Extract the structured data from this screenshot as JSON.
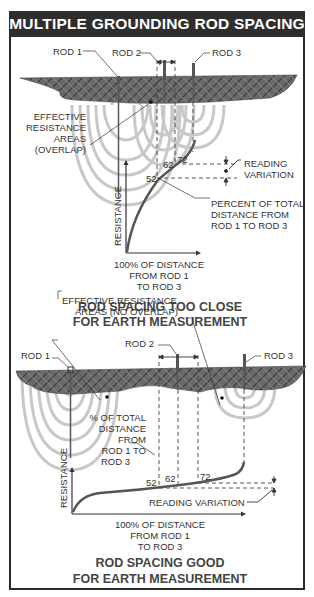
{
  "title": "MULTIPLE GROUNDING ROD SPACING",
  "panels": [
    {
      "id": "too-close",
      "rod_labels": [
        "ROD 1",
        "ROD 2",
        "ROD 3"
      ],
      "area_label": [
        "EFFECTIVE",
        "RESISTANCE",
        "AREAS",
        "(OVERLAP)"
      ],
      "y_axis_label": "RESISTANCE",
      "x_axis_label": [
        "100% OF DISTANCE",
        "FROM ROD 1",
        "TO ROD 3"
      ],
      "markers": [
        "52",
        "62",
        "72"
      ],
      "reading_variation_label": [
        "READING",
        "VARIATION"
      ],
      "percent_label": [
        "PERCENT OF TOTAL",
        "DISTANCE FROM",
        "ROD 1 TO ROD 3"
      ],
      "caption": [
        "ROD SPACING TOO CLOSE",
        "FOR EARTH MEASUREMENT"
      ]
    },
    {
      "id": "good",
      "rod_labels": [
        "ROD 1",
        "ROD 2",
        "ROD 3"
      ],
      "area_label": [
        "EFFECTIVE RESISTANCE",
        "AREAS (NO OVERLAP)"
      ],
      "y_axis_label": "RESISTANCE",
      "x_axis_label": [
        "100% OF DISTANCE",
        "FROM ROD 1",
        "TO ROD 3"
      ],
      "markers": [
        "52",
        "62",
        "72"
      ],
      "reading_variation_label": [
        "READING VARIATION"
      ],
      "percent_label": [
        "% OF TOTAL",
        "DISTANCE",
        "FROM",
        "ROD 1 TO",
        "ROD 3"
      ],
      "caption": [
        "ROD SPACING GOOD",
        "FOR EARTH MEASUREMENT"
      ]
    }
  ],
  "colors": {
    "title_bg": "#2e2e2e",
    "soil": "#5a5a5a",
    "arcs": "#c4c4c4",
    "curve": "#4a4a4a",
    "text": "#333333"
  }
}
